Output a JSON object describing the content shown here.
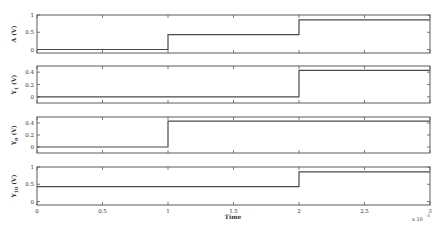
{
  "chart_data": [
    {
      "type": "line",
      "ylabel": "A (V)",
      "ylabel_main": "A",
      "ylabel_sub": "",
      "ylabel_unit": " (V)",
      "ylim": [
        -0.1,
        1.0
      ],
      "yticks": [
        0,
        0.5,
        1
      ],
      "ytick_labels": [
        "0",
        "0.5",
        "1"
      ],
      "x": [
        0,
        0.001,
        0.001,
        0.002,
        0.002,
        0.003
      ],
      "y": [
        0,
        0,
        0.43,
        0.43,
        0.86,
        0.86
      ]
    },
    {
      "type": "line",
      "ylabel": "Y1 (V)",
      "ylabel_main": "Y",
      "ylabel_sub": "1",
      "ylabel_unit": " (V)",
      "ylim": [
        -0.1,
        0.5
      ],
      "yticks": [
        0,
        0.2,
        0.4
      ],
      "ytick_labels": [
        "0",
        "0.2",
        "0.4"
      ],
      "x": [
        0,
        0.002,
        0.002,
        0.003
      ],
      "y": [
        0,
        0,
        0.43,
        0.43
      ]
    },
    {
      "type": "line",
      "ylabel": "Y0 (V)",
      "ylabel_main": "Y",
      "ylabel_sub": "0",
      "ylabel_unit": " (V)",
      "ylim": [
        -0.1,
        0.5
      ],
      "yticks": [
        0,
        0.2,
        0.4
      ],
      "ytick_labels": [
        "0",
        "0.2",
        "0.4"
      ],
      "x": [
        0,
        0.001,
        0.001,
        0.003
      ],
      "y": [
        0,
        0,
        0.43,
        0.43
      ]
    },
    {
      "type": "line",
      "ylabel": "Y10 (V)",
      "ylabel_main": "Y",
      "ylabel_sub": "10",
      "ylabel_unit": " (V)",
      "ylim": [
        -0.1,
        1.0
      ],
      "yticks": [
        0,
        0.5,
        1
      ],
      "ytick_labels": [
        "0",
        "0.5",
        "1"
      ],
      "x": [
        0,
        0.002,
        0.002,
        0.003
      ],
      "y": [
        0.43,
        0.43,
        0.86,
        0.86
      ]
    }
  ],
  "shared_x": {
    "xlabel": "Time",
    "xlim": [
      0,
      0.003
    ],
    "xticks": [
      0,
      0.0005,
      0.001,
      0.0015,
      0.002,
      0.0025,
      0.003
    ],
    "xtick_labels": [
      "0",
      "0.5",
      "1",
      "1.5",
      "2",
      "2.5",
      "3"
    ],
    "exponent_label": "x 10",
    "exponent_power": "-3"
  },
  "grid": false
}
